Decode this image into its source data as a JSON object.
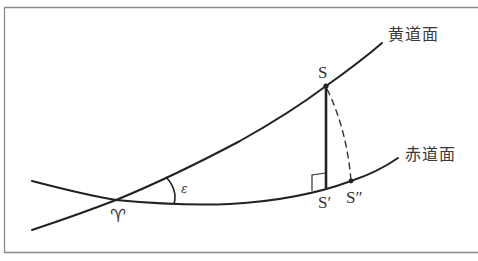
{
  "diagram": {
    "type": "celestial-sphere-ecliptic-equator",
    "colors": {
      "line": "#222222",
      "frame": "#888888",
      "text": "#333333",
      "background": "#ffffff"
    },
    "planes": [
      {
        "id": "ecliptic",
        "label": "黄道面"
      },
      {
        "id": "equator",
        "label": "赤道面"
      }
    ],
    "points": {
      "vernal_equinox": "♈",
      "S": "S",
      "S_prime": "S′",
      "S_double_prime": "S″"
    },
    "angle": {
      "symbol": "ε",
      "between": [
        "ecliptic",
        "equator"
      ]
    },
    "annotations": {
      "perpendicular": "S–S′ perpendicular to equator (right-angle mark)",
      "dashed_arc": "S to S″"
    }
  }
}
